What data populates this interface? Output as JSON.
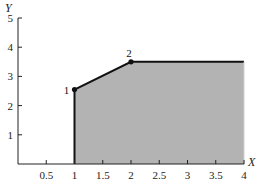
{
  "chart_data": {
    "type": "area",
    "title": "",
    "xlabel": "X",
    "ylabel": "Y",
    "xlim": [
      0,
      4
    ],
    "ylim": [
      0,
      5
    ],
    "grid": false,
    "x_ticks": [
      0.5,
      1,
      1.5,
      2,
      2.5,
      3,
      3.5,
      4
    ],
    "x_tick_labels": [
      "0.5",
      "1",
      "1.5",
      "2",
      "2.5",
      "3",
      "3.5",
      "4"
    ],
    "y_ticks": [
      1,
      2,
      3,
      4,
      5
    ],
    "y_tick_labels": [
      "1",
      "2",
      "3",
      "4",
      "5"
    ],
    "region_boundary": [
      {
        "x": 1,
        "y": 0
      },
      {
        "x": 1,
        "y": 2.55
      },
      {
        "x": 2,
        "y": 3.5
      },
      {
        "x": 4,
        "y": 3.5
      },
      {
        "x": 4,
        "y": 0
      }
    ],
    "points": [
      {
        "label": "1",
        "x": 1,
        "y": 2.55
      },
      {
        "label": "2",
        "x": 2,
        "y": 3.5
      }
    ],
    "fill_color": "#b3b3b3",
    "line_color": "#111111"
  }
}
